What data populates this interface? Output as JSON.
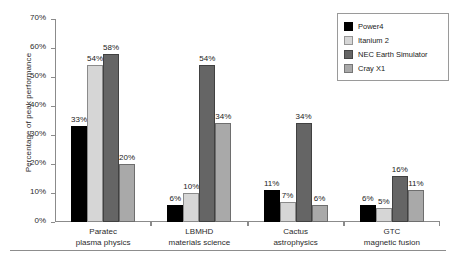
{
  "chart_data": {
    "type": "bar",
    "title": "",
    "subtitle": "",
    "xlabel": "",
    "ylabel": "Percentage of peak performance",
    "ylim": [
      0,
      70
    ],
    "grid": false,
    "legend_position": "top-right",
    "categories": [
      "Paratec",
      "LBMHD",
      "Cactus",
      "GTC"
    ],
    "category_sublabels": [
      "plasma physics",
      "materials science",
      "astrophysics",
      "magnetic fusion"
    ],
    "ytick_labels": [
      "70%",
      "60%",
      "50%",
      "40%",
      "30%",
      "20%",
      "10%",
      "0%"
    ],
    "ytick_values": [
      70,
      60,
      50,
      40,
      30,
      20,
      10,
      0
    ],
    "series": [
      {
        "name": "Power4",
        "color": "#000000",
        "values": [
          33,
          6,
          11,
          6
        ],
        "labels": [
          "33%",
          "6%",
          "11%",
          "6%"
        ]
      },
      {
        "name": "Itanium 2",
        "color": "#d6d6d6",
        "values": [
          54,
          10,
          7,
          5
        ],
        "labels": [
          "54%",
          "10%",
          "7%",
          "5%"
        ]
      },
      {
        "name": "NEC Earth Simulator",
        "color": "#656565",
        "values": [
          58,
          54,
          34,
          16
        ],
        "labels": [
          "58%",
          "54%",
          "34%",
          "16%"
        ]
      },
      {
        "name": "Cray X1",
        "color": "#a9a9a9",
        "values": [
          20,
          34,
          6,
          11
        ],
        "labels": [
          "20%",
          "34%",
          "6%",
          "11%"
        ]
      }
    ]
  }
}
